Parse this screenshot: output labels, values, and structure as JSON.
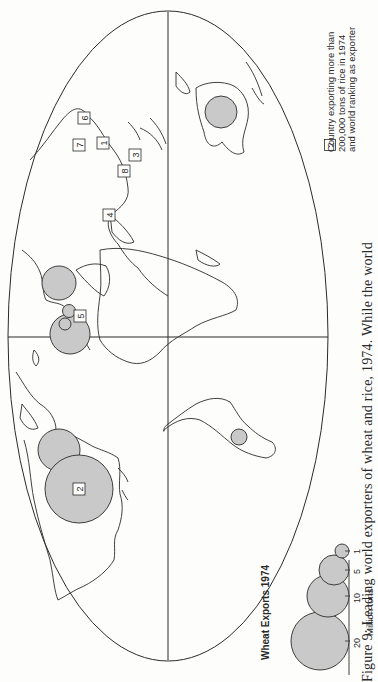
{
  "figure": {
    "caption": "Figure 9: Leading world exporters of wheat and rice, 1974. While the world",
    "orientation": "rotated 90° counter-clockwise"
  },
  "wheat_legend": {
    "title": "Wheat Exports 1974",
    "unit": "Million tons",
    "scale_values": [
      "20",
      "10",
      "5",
      "1"
    ],
    "circle_fill": "#c9c9c9"
  },
  "rice_legend": {
    "sample_rank": "2",
    "line1": "Country exporting more than",
    "line2": "200,000 tons of rice in 1974",
    "line3": "and world ranking as exporter"
  },
  "wheat_exporters": [
    {
      "region": "United States",
      "size": "largest"
    },
    {
      "region": "Canada",
      "size": "large"
    },
    {
      "region": "Australia",
      "size": "medium"
    },
    {
      "region": "Argentina",
      "size": "small"
    },
    {
      "region": "France",
      "size": "large"
    },
    {
      "region": "Europe (cluster)",
      "size": "small"
    },
    {
      "region": "USSR / Eastern Europe",
      "size": "large"
    }
  ],
  "rice_ranks": [
    {
      "rank": "1",
      "label": "1"
    },
    {
      "rank": "2",
      "label": "2"
    },
    {
      "rank": "3",
      "label": "3"
    },
    {
      "rank": "4",
      "label": "4"
    },
    {
      "rank": "5",
      "label": "5"
    },
    {
      "rank": "6",
      "label": "6"
    },
    {
      "rank": "7",
      "label": "7"
    },
    {
      "rank": "8",
      "label": "8"
    }
  ],
  "colors": {
    "line": "#2b2b2b",
    "circle_fill": "#c9c9c9",
    "background": "#fdfdfc"
  }
}
